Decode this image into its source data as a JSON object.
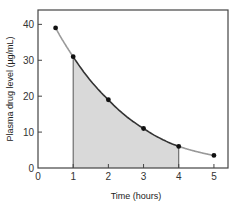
{
  "chart_data": {
    "type": "line",
    "title": "",
    "xlabel": "Time (hours)",
    "ylabel": "Plasma drug level (µg/mL)",
    "xlim": [
      0,
      5.4
    ],
    "ylim": [
      0,
      44
    ],
    "xticks": [
      0,
      1,
      2,
      3,
      4,
      5
    ],
    "yticks": [
      0,
      10,
      20,
      30,
      40
    ],
    "grid": false,
    "series": [
      {
        "name": "Plasma drug level",
        "x": [
          0.5,
          1,
          2,
          3,
          4,
          5
        ],
        "y": [
          39,
          31,
          19,
          11,
          6,
          3.5
        ]
      }
    ],
    "annotations": [
      {
        "type": "shaded-area-under-curve",
        "x_from": 1,
        "x_to": 4,
        "label": "AUC (1–4 h)"
      }
    ],
    "colors": {
      "curve_outside": "#999999",
      "curve_inside": "#333333",
      "fill": "#d9d9d9",
      "points": "#111111",
      "axes": "#444444"
    }
  }
}
